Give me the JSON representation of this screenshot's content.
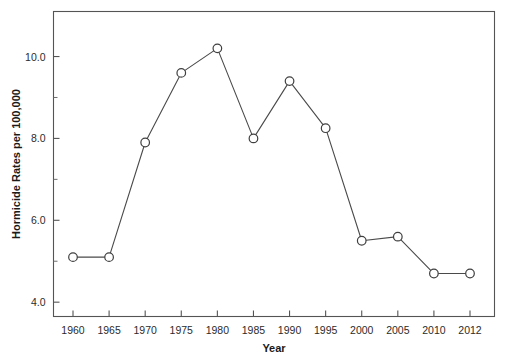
{
  "chart_data": {
    "type": "line",
    "title": "",
    "xlabel": "Year",
    "ylabel": "Hormicide Rates per 100,000",
    "categories": [
      "1960",
      "1965",
      "1970",
      "1975",
      "1980",
      "1985",
      "1990",
      "1995",
      "2000",
      "2005",
      "2010",
      "2012"
    ],
    "values": [
      5.1,
      5.1,
      7.9,
      9.6,
      10.2,
      8.0,
      9.4,
      8.25,
      5.5,
      5.6,
      4.7,
      4.7
    ],
    "series": [
      {
        "name": "Hormicide Rate",
        "values": [
          5.1,
          5.1,
          7.9,
          9.6,
          10.2,
          8.0,
          9.4,
          8.25,
          5.5,
          5.6,
          4.7,
          4.7
        ]
      }
    ],
    "ylim": [
      3.65,
      11.1
    ],
    "y_major_ticks": [
      4.0,
      6.0,
      8.0,
      10.0
    ],
    "y_major_tick_labels": [
      "4.0",
      "6.0",
      "8.0",
      "10.0"
    ],
    "y_minor_ticks": [
      5.0,
      7.0,
      9.0
    ],
    "grid": false,
    "legend": "none",
    "marker": "open-circle",
    "line_color": "#4a4a4a",
    "marker_fill": "#ffffff",
    "marker_stroke": "#3f3f3f",
    "axis_color": "#545454",
    "background": "#ffffff"
  },
  "axes": {
    "x_title": "Year",
    "y_title": "Hormicide Rates per 100,000"
  }
}
